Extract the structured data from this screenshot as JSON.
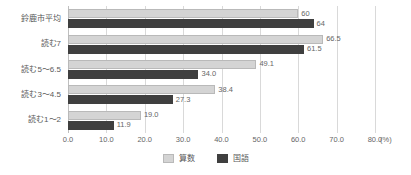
{
  "chart_data": {
    "type": "bar",
    "orientation": "horizontal",
    "title": "",
    "xlabel": "(%)",
    "ylabel": "",
    "xlim": [
      0.0,
      80.0
    ],
    "xticks": [
      "0.0",
      "10.0",
      "20.0",
      "30.0",
      "40.0",
      "50.0",
      "60.0",
      "70.0",
      "80.0"
    ],
    "xtick_values": [
      0,
      10,
      20,
      30,
      40,
      50,
      60,
      70,
      80
    ],
    "grid": true,
    "legend_position": "bottom-center",
    "categories": [
      "鈴鹿市平均",
      "読む7",
      "読む5～6.5",
      "読む3～4.5",
      "読む1～2"
    ],
    "series": [
      {
        "name": "算数",
        "color": "#d4d4d4",
        "values": [
          60,
          66.5,
          49.1,
          38.4,
          19.0
        ],
        "labels": [
          "60",
          "66.5",
          "49.1",
          "38.4",
          "19.0"
        ]
      },
      {
        "name": "国語",
        "color": "#3f3f3f",
        "values": [
          64,
          61.5,
          34.0,
          27.3,
          11.9
        ],
        "labels": [
          "64",
          "61.5",
          "34.0",
          "27.3",
          "11.9"
        ]
      }
    ]
  },
  "legend": {
    "items": [
      {
        "label": "算数",
        "color": "#d4d4d4"
      },
      {
        "label": "国語",
        "color": "#3f3f3f"
      }
    ]
  },
  "axis": {
    "unit_label": "(%)"
  },
  "colors": {
    "series_sansu": "#d4d4d4",
    "series_kokugo": "#3f3f3f",
    "gridline": "#d9d9d9",
    "text": "#595959"
  }
}
